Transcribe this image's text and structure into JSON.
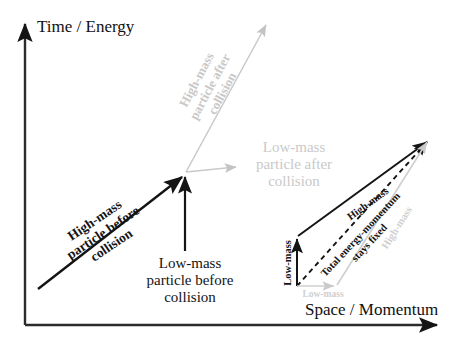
{
  "figure": {
    "background_color": "#ffffff",
    "black_color": "#141414",
    "grey_color": "#c9c9c9",
    "width": 458,
    "height": 349
  },
  "axes": {
    "y_label": "Time / Energy",
    "x_label": "Space / Momentum"
  },
  "before": {
    "high_mass_label": "High-mass\nparticle before\ncollision",
    "high_mass_line1": "High-mass",
    "high_mass_line2": "particle before",
    "high_mass_line3": "collision",
    "low_mass_line1": "Low-mass",
    "low_mass_line2": "particle before",
    "low_mass_line3": "collision"
  },
  "after": {
    "high_mass_line1": "High-mass",
    "high_mass_line2": "particle after",
    "high_mass_line3": "collision",
    "low_mass_line1": "Low-mass",
    "low_mass_line2": "particle after",
    "low_mass_line3": "collision"
  },
  "inset": {
    "low_mass_black": "Low-mass",
    "high_mass_black": "High-mass",
    "total_line1": "Total energy-momentum",
    "total_line2": "stays fixed",
    "high_mass_grey": "High-mass",
    "low_mass_grey": "Low-mass"
  }
}
